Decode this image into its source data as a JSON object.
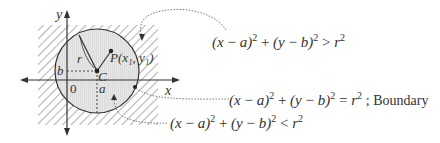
{
  "diagram": {
    "type": "circle-region-inequalities",
    "axes": {
      "x_label": "x",
      "y_label": "y",
      "origin_label": "0"
    },
    "circle": {
      "center_label": "C",
      "center_x_label": "a",
      "center_y_label": "b",
      "radius_label": "r",
      "point_label": "P(x₁, y₁)"
    },
    "regions": [
      {
        "name": "outside",
        "lhs": "(x − a)² + (y − b)²",
        "relation": ">",
        "rhs": "r²",
        "note": ""
      },
      {
        "name": "boundary",
        "lhs": "(x − a)² + (y − b)²",
        "relation": "=",
        "rhs": "r²",
        "note": "; Boundary"
      },
      {
        "name": "inside",
        "lhs": "(x − a)² + (y − b)²",
        "relation": "<",
        "rhs": "r²",
        "note": ""
      }
    ],
    "colors": {
      "hatch": "#b8b8b8",
      "circle_fill": "#e4e4e4",
      "stroke": "#333333"
    }
  }
}
